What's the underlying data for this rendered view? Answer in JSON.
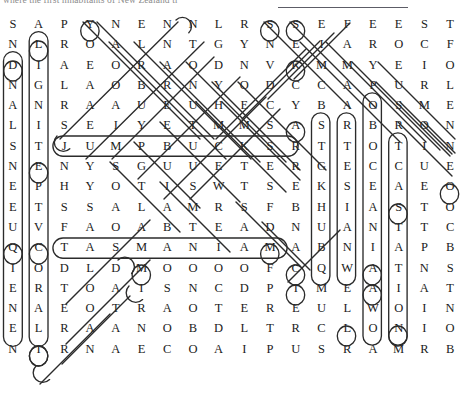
{
  "header": {
    "partial_title": "where the first inhabitants of New Zealand tr",
    "rule_visible": true
  },
  "puzzle": {
    "type": "word-search",
    "columns": 18,
    "rows": 17,
    "grid": [
      [
        "S",
        "A",
        "P",
        "Y",
        "N",
        "E",
        "N",
        "N",
        "L",
        "R",
        "S",
        "S",
        "E",
        "F",
        "E",
        "E",
        "S",
        "T"
      ],
      [
        "N",
        "L",
        "R",
        "O",
        "A",
        "L",
        "N",
        "T",
        "G",
        "Y",
        "N",
        "E",
        "I",
        "A",
        "R",
        "O",
        "C",
        "F"
      ],
      [
        "D",
        "I",
        "A",
        "E",
        "O",
        "R",
        "A",
        "O",
        "D",
        "N",
        "V",
        "K",
        "M",
        "M",
        "Y",
        "E",
        "I",
        "O"
      ],
      [
        "N",
        "G",
        "L",
        "A",
        "O",
        "B",
        "R",
        "N",
        "Y",
        "O",
        "D",
        "C",
        "C",
        "A",
        "P",
        "U",
        "R",
        "L"
      ],
      [
        "A",
        "N",
        "R",
        "A",
        "A",
        "U",
        "E",
        "U",
        "H",
        "E",
        "C",
        "Y",
        "B",
        "A",
        "O",
        "S",
        "M",
        "E"
      ],
      [
        "L",
        "I",
        "S",
        "E",
        "I",
        "Y",
        "E",
        "T",
        "M",
        "M",
        "S",
        "A",
        "S",
        "R",
        "B",
        "R",
        "O",
        "N"
      ],
      [
        "S",
        "T",
        "J",
        "U",
        "M",
        "P",
        "B",
        "U",
        "C",
        "K",
        "S",
        "R",
        "T",
        "T",
        "O",
        "T",
        "I",
        "N"
      ],
      [
        "N",
        "E",
        "N",
        "Y",
        "S",
        "G",
        "U",
        "U",
        "E",
        "T",
        "E",
        "R",
        "G",
        "E",
        "C",
        "C",
        "U",
        "E"
      ],
      [
        "E",
        "P",
        "H",
        "Y",
        "O",
        "T",
        "I",
        "S",
        "W",
        "T",
        "S",
        "E",
        "K",
        "S",
        "E",
        "A",
        "E",
        "O"
      ],
      [
        "E",
        "T",
        "S",
        "S",
        "A",
        "L",
        "A",
        "M",
        "R",
        "S",
        "F",
        "B",
        "H",
        "I",
        "A",
        "S",
        "T",
        "O"
      ],
      [
        "U",
        "V",
        "F",
        "A",
        "O",
        "A",
        "B",
        "T",
        "E",
        "A",
        "D",
        "N",
        "U",
        "A",
        "N",
        "T",
        "T",
        "C"
      ],
      [
        "Q",
        "C",
        "T",
        "A",
        "S",
        "M",
        "A",
        "N",
        "I",
        "A",
        "M",
        "A",
        "B",
        "N",
        "I",
        "A",
        "P",
        "B"
      ],
      [
        "I",
        "O",
        "D",
        "L",
        "D",
        "M",
        "O",
        "O",
        "O",
        "O",
        "F",
        "C",
        "Q",
        "W",
        "A",
        "T",
        "N",
        "S"
      ],
      [
        "E",
        "R",
        "T",
        "O",
        "A",
        "I",
        "S",
        "N",
        "C",
        "D",
        "P",
        "I",
        "M",
        "E",
        "A",
        "I",
        "A",
        "T"
      ],
      [
        "N",
        "A",
        "E",
        "O",
        "T",
        "R",
        "A",
        "O",
        "T",
        "E",
        "R",
        "E",
        "U",
        "L",
        "W",
        "O",
        "I",
        "N"
      ],
      [
        "E",
        "L",
        "R",
        "A",
        "A",
        "N",
        "O",
        "B",
        "D",
        "L",
        "T",
        "R",
        "C",
        "L",
        "O",
        "N",
        "I",
        "O"
      ],
      [
        "N",
        "I",
        "R",
        "N",
        "A",
        "E",
        "C",
        "O",
        "A",
        "I",
        "P",
        "U",
        "S",
        "R",
        "A",
        "M",
        "R",
        "B"
      ]
    ],
    "found_words_visible": [
      "JUMPBUCKS",
      "TASMANIA"
    ]
  },
  "style": {
    "ink": "#1b1b1b",
    "marker": "#2a2a2a",
    "paper": "#ffffff"
  }
}
